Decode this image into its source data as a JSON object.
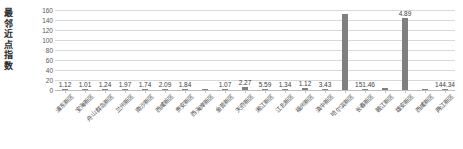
{
  "chart_data": {
    "type": "bar",
    "title": "",
    "ylabel": "最邻近点指数",
    "xlabel": "",
    "ylim": [
      0,
      160
    ],
    "yticks": [
      0,
      20,
      40,
      60,
      80,
      100,
      120,
      140,
      160
    ],
    "grid": true,
    "legend": "none",
    "bar_color": "#808080",
    "categories": [
      "浦东新区",
      "宝海新区",
      "舟山群岛新区",
      "兰州新区",
      "南沙新区",
      "西咸新区",
      "贵安新区",
      "西海岸新区",
      "金普新区",
      "天府新区",
      "湘江新区",
      "江北新区",
      "福州新区",
      "滇中新区",
      "哈尔滨新区",
      "长春新区",
      "赣江新区",
      "雄安新区",
      "西咸新区",
      "两江新区"
    ],
    "values": [
      1.12,
      1.01,
      1.24,
      1.97,
      1.74,
      2.09,
      1.84,
      1.07,
      2.27,
      5.59,
      1.34,
      1.12,
      3.43,
      2.1,
      151.46,
      1.9,
      4.89,
      144.34,
      1.5,
      1.3
    ],
    "labels": [
      "1.12",
      "1.01",
      "1.24",
      "1.97",
      "1.74",
      "2.09",
      "1.84",
      "",
      "1.07",
      "2.27",
      "5.59",
      "1.34",
      "1.12",
      "3.43",
      "",
      "151.46",
      "",
      "4.89",
      "",
      "144.34"
    ]
  }
}
